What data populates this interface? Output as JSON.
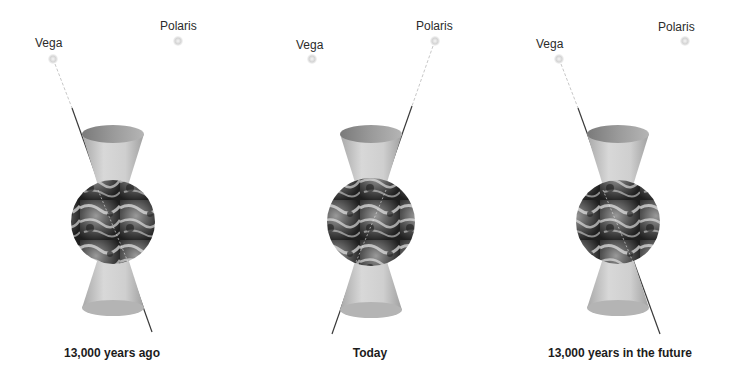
{
  "diagram": {
    "panels": [
      {
        "caption": "13,000 years ago",
        "stars": {
          "vega": "Vega",
          "polaris": "Polaris"
        },
        "axis_points_to": "Vega"
      },
      {
        "caption": "Today",
        "stars": {
          "vega": "Vega",
          "polaris": "Polaris"
        },
        "axis_points_to": "Polaris"
      },
      {
        "caption": "13,000 years in the future",
        "stars": {
          "vega": "Vega",
          "polaris": "Polaris"
        },
        "axis_points_to": "Vega"
      }
    ],
    "colors": {
      "background": "#ffffff",
      "cone": "#bdbdbd",
      "cone_rim": "#8a8a8a",
      "axis_line": "#3a3a3a",
      "star_dot": "#d6d6d6",
      "text": "#231f20"
    }
  }
}
